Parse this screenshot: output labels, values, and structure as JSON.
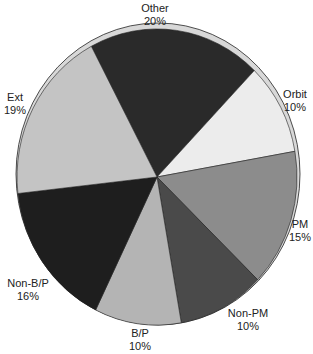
{
  "chart_data": {
    "type": "pie",
    "title": "",
    "slices": [
      {
        "label": "Other",
        "value": 20,
        "pct_label": "20%",
        "color": "#2a2a2a",
        "lx": 155,
        "ly": 2
      },
      {
        "label": "Orbit",
        "value": 10,
        "pct_label": "10%",
        "color": "#ececec",
        "lx": 295,
        "ly": 88
      },
      {
        "label": "PM",
        "value": 15,
        "pct_label": "15%",
        "color": "#8c8c8c",
        "lx": 300,
        "ly": 218
      },
      {
        "label": "Non-PM",
        "value": 10,
        "pct_label": "10%",
        "color": "#4a4a4a",
        "lx": 248,
        "ly": 307
      },
      {
        "label": "B/P",
        "value": 10,
        "pct_label": "10%",
        "color": "#b4b4b4",
        "lx": 140,
        "ly": 327
      },
      {
        "label": "Non-B/P",
        "value": 16,
        "pct_label": "16%",
        "color": "#1e1e1e",
        "lx": 28,
        "ly": 277
      },
      {
        "label": "Ext",
        "value": 19,
        "pct_label": "19%",
        "color": "#c4c4c4",
        "lx": 15,
        "ly": 91
      }
    ],
    "legend": "none",
    "depth_color": "#d8d8d8"
  }
}
